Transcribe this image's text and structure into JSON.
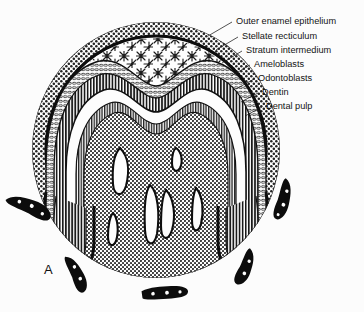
{
  "figure": {
    "panel_letter": "A",
    "background_color": "#fcfcfc",
    "ink_color": "#131313"
  },
  "labels": [
    {
      "id": "outer-enamel-epithelium",
      "text": "Outer enamel epithelium",
      "text_x": 236,
      "text_y": 22,
      "lx1": 232,
      "ly1": 22,
      "lx2": 208,
      "ly2": 36
    },
    {
      "id": "stellate-reticulum",
      "text": "Stellate recticulum",
      "text_x": 242,
      "text_y": 37,
      "lx1": 238,
      "ly1": 37,
      "lx2": 216,
      "ly2": 50
    },
    {
      "id": "stratum-intermedium",
      "text": "Stratum intermedium",
      "text_x": 246,
      "text_y": 51,
      "lx1": 242,
      "ly1": 51,
      "lx2": 222,
      "ly2": 63
    },
    {
      "id": "ameloblasts",
      "text": "Ameloblasts",
      "text_x": 254,
      "text_y": 65,
      "lx1": 250,
      "ly1": 65,
      "lx2": 231,
      "ly2": 76
    },
    {
      "id": "odontoblasts",
      "text": "Odontoblasts",
      "text_x": 258,
      "text_y": 79,
      "lx1": 254,
      "ly1": 79,
      "lx2": 236,
      "ly2": 89
    },
    {
      "id": "dentin",
      "text": "Dentin",
      "text_x": 262,
      "text_y": 93,
      "lx1": 258,
      "ly1": 93,
      "lx2": 241,
      "ly2": 102
    },
    {
      "id": "dental-pulp",
      "text": "Dental pulp",
      "text_x": 266,
      "text_y": 107,
      "lx1": 262,
      "ly1": 107,
      "lx2": 245,
      "ly2": 116
    }
  ],
  "panel_label": {
    "text": "A",
    "x": 44,
    "y": 274
  },
  "tooth_germ": {
    "center_x": 156,
    "center_y": 150,
    "radius_x": 124,
    "radius_y": 128
  },
  "bone_fragments": [
    {
      "id": "bone-left-upper",
      "cx": 30,
      "cy": 205,
      "rot": -62,
      "w": 15,
      "h": 48
    },
    {
      "id": "bone-left-lower",
      "cx": 78,
      "cy": 273,
      "rot": -22,
      "w": 13,
      "h": 40
    },
    {
      "id": "bone-bottom",
      "cx": 165,
      "cy": 293,
      "rot": -8,
      "w": 13,
      "h": 46
    },
    {
      "id": "bone-right-lower",
      "cx": 247,
      "cy": 268,
      "rot": 26,
      "w": 13,
      "h": 40
    },
    {
      "id": "bone-right-upper",
      "cx": 285,
      "cy": 200,
      "rot": 18,
      "w": 13,
      "h": 42
    }
  ]
}
